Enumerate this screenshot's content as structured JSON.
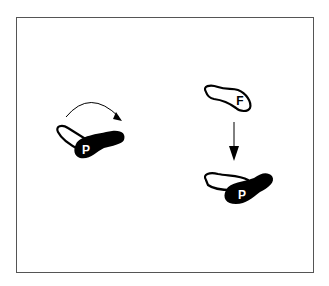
{
  "figure": {
    "colors": {
      "background": "#ffffff",
      "frame": "#555555",
      "ink": "#000000",
      "label_on_dark": "#ffffff"
    },
    "left_group": {
      "foot_label": "P",
      "motion": "curved-arrow-clockwise"
    },
    "right_group": {
      "top_foot_label": "F",
      "bottom_foot_label": "P",
      "motion": "down-arrow"
    }
  }
}
